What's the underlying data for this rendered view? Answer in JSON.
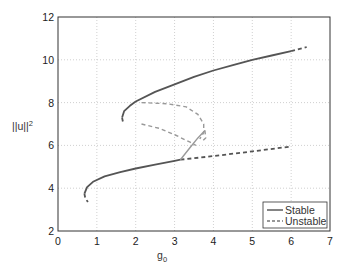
{
  "chart_data": {
    "type": "line",
    "title": "",
    "xlabel": "g0",
    "ylabel": "||u||²",
    "xlim": [
      0,
      7
    ],
    "ylim": [
      2,
      12
    ],
    "xticks": [
      0,
      1,
      2,
      3,
      4,
      5,
      6,
      7
    ],
    "yticks": [
      2,
      4,
      6,
      8,
      10,
      12
    ],
    "grid": true,
    "legend": {
      "position": "lower right",
      "entries": [
        "Stable",
        "Unstable"
      ]
    },
    "series": [
      {
        "name": "Stable",
        "style": "solid",
        "color": "#555555",
        "points": [
          [
            0.68,
            3.75
          ],
          [
            0.75,
            4.05
          ],
          [
            0.9,
            4.3
          ],
          [
            1.2,
            4.55
          ],
          [
            1.6,
            4.75
          ],
          [
            2.0,
            4.92
          ],
          [
            2.5,
            5.1
          ],
          [
            3.0,
            5.28
          ],
          [
            3.15,
            5.33
          ]
        ]
      },
      {
        "name": "Unstable",
        "style": "dashed",
        "color": "#555555",
        "points": [
          [
            0.68,
            3.75
          ],
          [
            0.7,
            3.55
          ],
          [
            0.77,
            3.35
          ]
        ]
      },
      {
        "name": "Unstable",
        "style": "dashed",
        "color": "#555555",
        "points": [
          [
            3.15,
            5.33
          ],
          [
            4.0,
            5.5
          ],
          [
            5.0,
            5.72
          ],
          [
            6.0,
            5.95
          ]
        ]
      },
      {
        "name": "Stable",
        "style": "solid",
        "color": "#555555",
        "points": [
          [
            1.65,
            7.3
          ],
          [
            1.7,
            7.6
          ],
          [
            1.85,
            7.85
          ],
          [
            2.0,
            8.05
          ],
          [
            2.5,
            8.5
          ],
          [
            3.0,
            8.85
          ],
          [
            3.5,
            9.2
          ],
          [
            4.0,
            9.5
          ],
          [
            4.5,
            9.75
          ],
          [
            5.0,
            10.0
          ],
          [
            5.5,
            10.2
          ],
          [
            6.0,
            10.4
          ]
        ]
      },
      {
        "name": "Unstable",
        "style": "dashed",
        "color": "#555555",
        "points": [
          [
            6.0,
            10.4
          ],
          [
            6.4,
            10.6
          ]
        ]
      },
      {
        "name": "Unstable",
        "style": "dashed",
        "color": "#555555",
        "points": [
          [
            1.65,
            7.3
          ],
          [
            1.68,
            7.0
          ]
        ]
      },
      {
        "name": "Unstable (secondary)",
        "style": "dashed",
        "color": "#999999",
        "points": [
          [
            2.15,
            8.0
          ],
          [
            2.8,
            7.95
          ],
          [
            3.3,
            7.8
          ],
          [
            3.6,
            7.45
          ],
          [
            3.75,
            7.0
          ],
          [
            3.75,
            6.6
          ],
          [
            3.65,
            6.3
          ]
        ]
      },
      {
        "name": "Unstable (secondary)",
        "style": "dashed",
        "color": "#999999",
        "points": [
          [
            2.15,
            7.0
          ],
          [
            2.6,
            6.8
          ],
          [
            3.0,
            6.5
          ],
          [
            3.4,
            6.15
          ],
          [
            3.55,
            6.0
          ]
        ]
      },
      {
        "name": "Stable (secondary)",
        "style": "solid",
        "color": "#999999",
        "points": [
          [
            3.15,
            5.33
          ],
          [
            3.4,
            5.9
          ],
          [
            3.6,
            6.35
          ],
          [
            3.78,
            6.7
          ]
        ]
      },
      {
        "name": "Unstable (secondary)",
        "style": "dashed",
        "color": "#999999",
        "points": [
          [
            3.78,
            6.7
          ],
          [
            3.8,
            6.35
          ],
          [
            3.72,
            6.2
          ]
        ]
      }
    ]
  },
  "legend": {
    "stable": "Stable",
    "unstable": "Unstable"
  },
  "axes": {
    "xlabel": "g",
    "xlabel_sub": "0",
    "ylabel": "||u||",
    "ylabel_sup": "2"
  }
}
